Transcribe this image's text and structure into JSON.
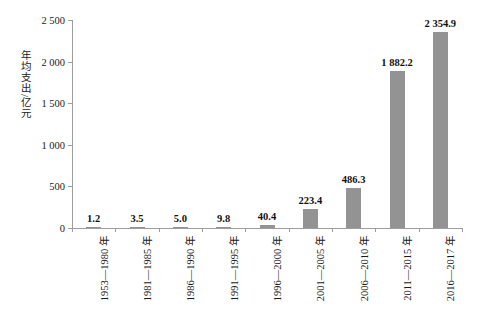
{
  "chart_data": {
    "type": "bar",
    "title": "",
    "subtitle": "",
    "xlabel": "",
    "ylabel": "年均支出/亿元",
    "ylim": [
      0,
      2500
    ],
    "grid": false,
    "legend": null,
    "bar_color": "#939393",
    "axis_color": "#9d9d9d",
    "background_color": "#ffffff",
    "categories": [
      "1953—1980 年",
      "1981—1985 年",
      "1986—1990 年",
      "1991—1995 年",
      "1996—2000 年",
      "2001—2005 年",
      "2006—2010 年",
      "2011—2015 年",
      "2016—2017 年"
    ],
    "values": [
      1.2,
      3.5,
      5.0,
      9.8,
      40.4,
      223.4,
      486.3,
      1882.2,
      2354.9
    ],
    "value_labels": [
      "1.2",
      "3.5",
      "5.0",
      "9.8",
      "40.4",
      "223.4",
      "486.3",
      "1 882.2",
      "2 354.9"
    ],
    "ytick_values": [
      0,
      500,
      1000,
      1500,
      2000,
      2500
    ],
    "ytick_labels": [
      "0",
      "500",
      "1 000",
      "1 500",
      "2 000",
      "2 500"
    ]
  }
}
